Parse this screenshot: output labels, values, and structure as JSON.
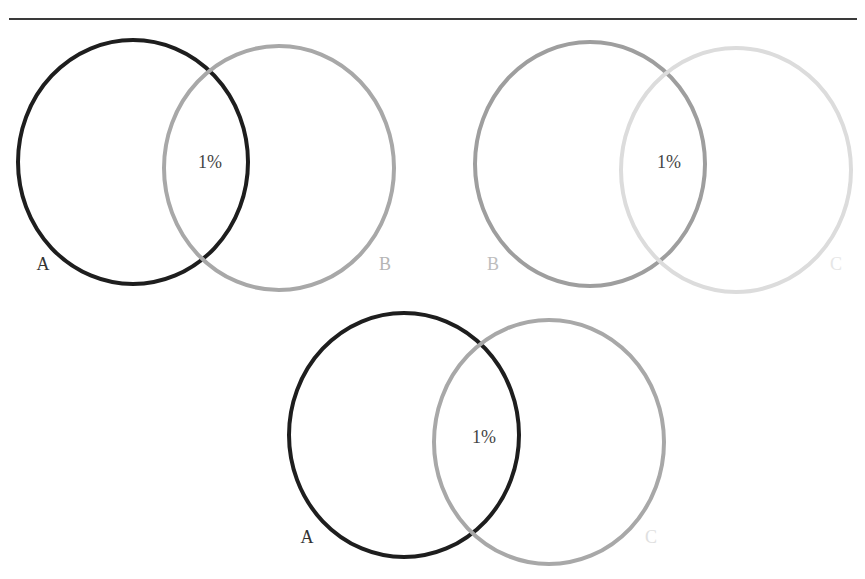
{
  "figure": {
    "diagrams": [
      {
        "id": "A-B",
        "intersection_label": "1%",
        "sets": [
          {
            "label": "A",
            "stroke": "#1e1e1e",
            "label_color": "#333333"
          },
          {
            "label": "B",
            "stroke": "#a8a8a8",
            "label_color": "#b5b5b5"
          }
        ]
      },
      {
        "id": "B-C",
        "intersection_label": "1%",
        "sets": [
          {
            "label": "B",
            "stroke": "#9e9e9e",
            "label_color": "#bdbdbd"
          },
          {
            "label": "C",
            "stroke": "#dcdcdc",
            "label_color": "#e6e6e6"
          }
        ]
      },
      {
        "id": "A-C",
        "intersection_label": "1%",
        "sets": [
          {
            "label": "A",
            "stroke": "#1e1e1e",
            "label_color": "#333333"
          },
          {
            "label": "C",
            "stroke": "#a8a8a8",
            "label_color": "#e0e0e0"
          }
        ]
      }
    ],
    "text_color": "#444444"
  }
}
